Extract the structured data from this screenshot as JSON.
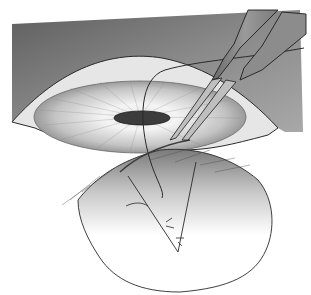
{
  "illustration": {
    "subject": "surgical illustration",
    "elements": [
      "background-shading",
      "eye-globe",
      "iris",
      "pupil",
      "forceps",
      "curved-needle",
      "suture-thread",
      "tissue-flap",
      "stitches"
    ],
    "colors": {
      "background": "#ffffff",
      "shade_dark": "#5a5a5a",
      "shade_mid": "#9a9a9a",
      "shade_light": "#d6d6d6",
      "line": "#2a2a2a",
      "pupil": "#3c3c3c"
    }
  }
}
